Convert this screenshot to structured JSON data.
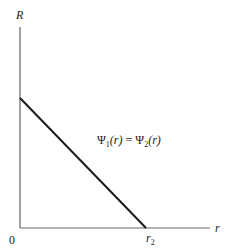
{
  "diagram": {
    "y_axis_label": "R",
    "x_axis_label": "r",
    "origin_label": "0",
    "x_intercept_label": {
      "base": "r",
      "sub": "2"
    },
    "line_label": {
      "psi": "Ψ",
      "sub1": "1",
      "sub2": "2",
      "arg": "(r)",
      "eq": " = "
    },
    "colors": {
      "axis": "#555555",
      "line": "#1a1a1a",
      "text": "#222222"
    }
  }
}
